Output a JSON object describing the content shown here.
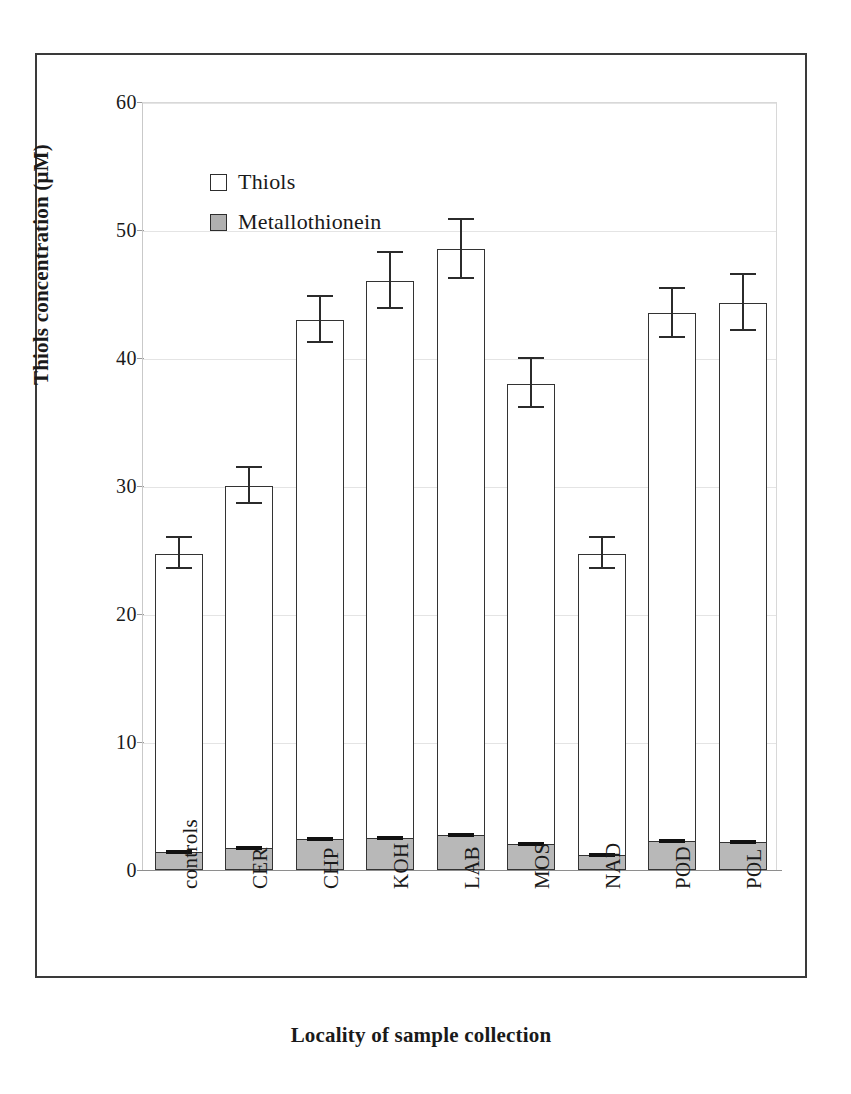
{
  "chart_data": {
    "type": "bar",
    "title": "",
    "subtitle": "",
    "xlabel": "Locality of sample collection",
    "ylabel": "Thiols concentration (μM)",
    "ylim": [
      0,
      60
    ],
    "ytick_labels": [
      "0",
      "10",
      "20",
      "30",
      "40",
      "50",
      "60"
    ],
    "ytick_values": [
      0,
      10,
      20,
      30,
      40,
      50,
      60
    ],
    "grid": true,
    "grid_axis": "y",
    "stacked": true,
    "legend_position": "inside-top-left",
    "categories": [
      "controls",
      "CER",
      "CHP",
      "KOH",
      "LAB",
      "MOS",
      "NAD",
      "POD",
      "POL"
    ],
    "series": [
      {
        "name": "Thiols",
        "color": "#ffffff",
        "edge_color": "#333333",
        "values": [
          24.7,
          30.0,
          43.0,
          46.0,
          48.5,
          38.0,
          24.7,
          43.5,
          44.3
        ],
        "errors": [
          1.2,
          1.4,
          1.8,
          2.2,
          2.3,
          1.9,
          1.2,
          1.9,
          2.2
        ]
      },
      {
        "name": "Metallothionein",
        "color": "#b8b8b8",
        "edge_color": "#333333",
        "values": [
          1.4,
          1.7,
          2.4,
          2.5,
          2.7,
          2.0,
          1.2,
          2.3,
          2.2
        ],
        "errors": [
          0.2,
          0.25,
          0.2,
          0.2,
          0.2,
          0.2,
          0.2,
          0.25,
          0.25
        ]
      }
    ]
  },
  "legend": {
    "items": [
      {
        "label": "Thiols",
        "swatch": "white-square"
      },
      {
        "label": "Metallothionein",
        "swatch": "gray-square"
      }
    ]
  },
  "axes": {
    "y_title": "Thiols concentration (μM)",
    "x_title": "Locality of sample collection"
  },
  "ticks": {
    "y": [
      "60",
      "50",
      "40",
      "30",
      "20",
      "10",
      "0"
    ],
    "x": [
      "controls",
      "CER",
      "CHP",
      "KOH",
      "LAB",
      "MOS",
      "NAD",
      "POD",
      "POL"
    ]
  }
}
